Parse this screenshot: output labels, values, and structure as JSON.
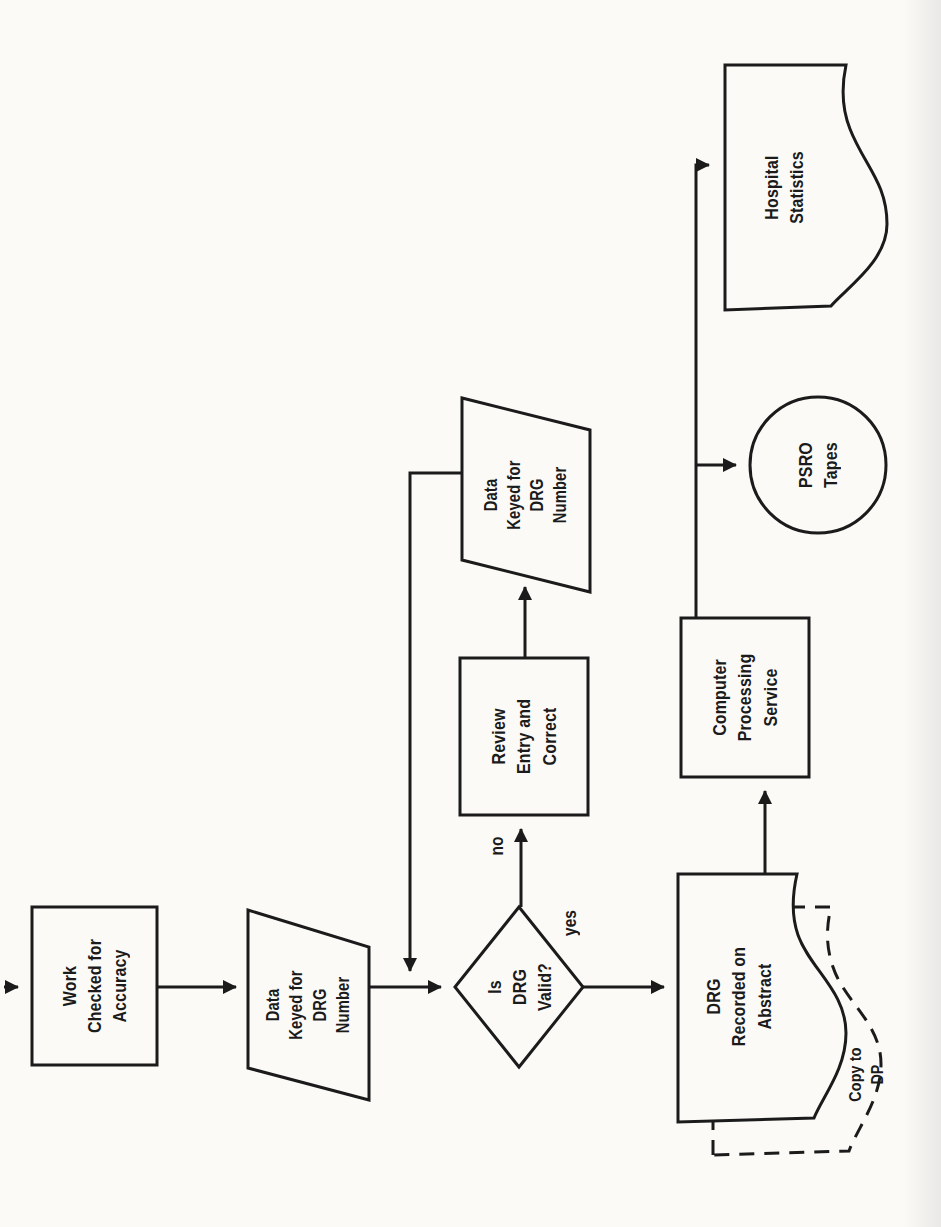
{
  "diagram": {
    "type": "flowchart",
    "orientation": "page rotated 90 degrees (landscape scan)",
    "colors": {
      "ink": "#1b1b1b",
      "paper": "#fbfaf7"
    },
    "nodes": {
      "work_checked": {
        "shape": "rectangle",
        "label": "Work\nChecked for\nAccuracy"
      },
      "data_keyed_1": {
        "shape": "parallelogram",
        "label": "Data\nKeyed for\nDRG\nNumber"
      },
      "drg_valid": {
        "shape": "decision-diamond",
        "label": "Is\nDRG\nValid?"
      },
      "review_entry": {
        "shape": "rectangle",
        "label": "Review\nEntry and\nCorrect"
      },
      "data_keyed_2": {
        "shape": "parallelogram",
        "label": "Data\nKeyed for\nDRG\nNumber"
      },
      "drg_recorded": {
        "shape": "document",
        "label": "DRG\nRecorded on\nAbstract"
      },
      "copy_to_dp": {
        "shape": "document-dashed",
        "label": "Copy to\nDP"
      },
      "computer_processing": {
        "shape": "rectangle",
        "label": "Computer\nProcessing\nService"
      },
      "psro_tapes": {
        "shape": "circle",
        "label": "PSRO\nTapes"
      },
      "hospital_statistics": {
        "shape": "document",
        "label": "Hospital\nStatistics"
      }
    },
    "edge_labels": {
      "yes": "yes",
      "no": "no"
    }
  }
}
